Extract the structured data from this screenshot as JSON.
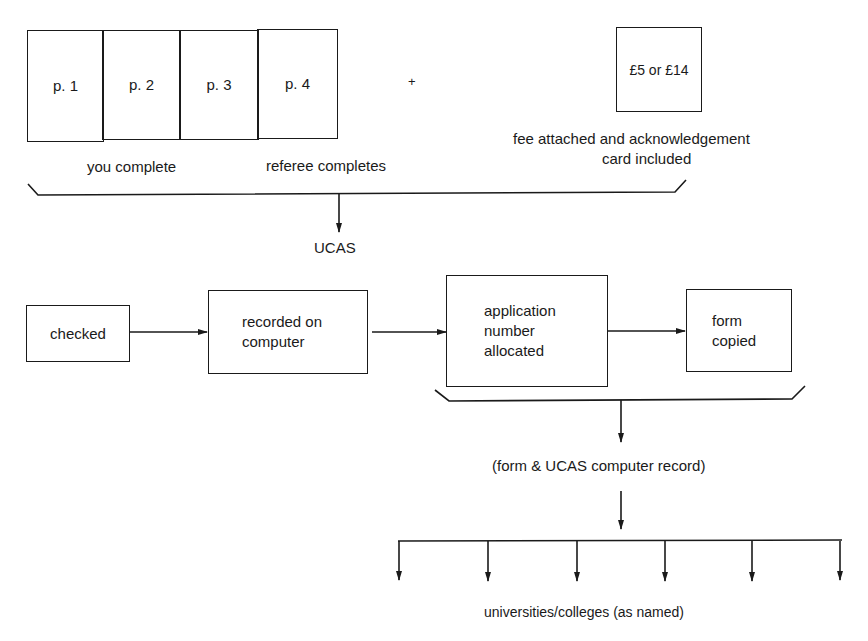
{
  "form_pages": [
    {
      "label": "p. 1"
    },
    {
      "label": "p. 2"
    },
    {
      "label": "p. 3"
    },
    {
      "label": "p. 4"
    }
  ],
  "plus_sign": "+",
  "fee_box": {
    "label": "£5 or £14"
  },
  "fee_caption": {
    "line1": "fee attached and acknowledgement",
    "line2": "card included"
  },
  "you_complete": "you complete",
  "referee_completes": "referee completes",
  "ucas_label": "UCAS",
  "process_steps": [
    {
      "line1": "checked"
    },
    {
      "line1": "recorded on",
      "line2": "computer"
    },
    {
      "line1": "application",
      "line2": "number",
      "line3": "allocated"
    },
    {
      "line1": "form",
      "line2": "copied"
    }
  ],
  "record_label": "(form & UCAS computer record)",
  "destinations_label": "universities/colleges (as named)",
  "destination_arrow_count": 6
}
